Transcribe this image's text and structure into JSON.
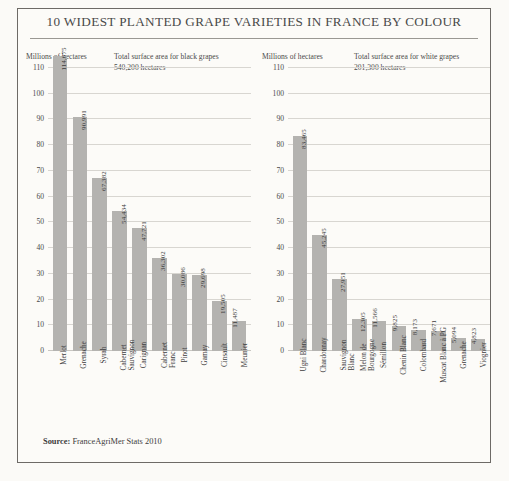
{
  "title": "10 WIDEST PLANTED GRAPE VARIETIES IN FRANCE BY COLOUR",
  "source_label": "Source:",
  "source_text": "FranceAgriMer Stats 2010",
  "axis_caption": "Millions of hectares",
  "panels": {
    "black": {
      "total_line1": "Total surface area for black grapes",
      "total_line2": "540,200 hectares"
    },
    "white": {
      "total_line1": "Total surface area for white grapes",
      "total_line2": "201,300 hectares"
    }
  },
  "yticks": [
    "110",
    "100",
    "90",
    "80",
    "70",
    "60",
    "50",
    "40",
    "30",
    "20",
    "10",
    "0"
  ],
  "colors": {
    "bar": "#b4b3b0",
    "frame": "#6d6a66",
    "grid": "#d8d6d1",
    "text": "#3c3c3c",
    "background": "#fcfbf8"
  },
  "chart_data": [
    {
      "type": "bar",
      "title": "Total surface area for black grapes",
      "subtitle": "540,200 hectares",
      "xlabel": "",
      "ylabel": "Millions of hectares",
      "ylim": [
        0,
        110
      ],
      "ytick_step": 10,
      "grid": true,
      "legend": "none",
      "units": "hectares",
      "value_scale": 1000,
      "categories": [
        "Merlot",
        "Grenache",
        "Syrah",
        "Cabernet Sauvignon",
        "Carignan",
        "Cabernet Franc",
        "Pinot",
        "Gamay",
        "Cinsault",
        "Meunier"
      ],
      "category_lines": [
        [
          "Merlot",
          ""
        ],
        [
          "Grenache",
          ""
        ],
        [
          "Syrah",
          ""
        ],
        [
          "Cabernet",
          "Sauvignon"
        ],
        [
          "Carignan",
          ""
        ],
        [
          "Cabernet",
          "Franc"
        ],
        [
          "Pinot",
          ""
        ],
        [
          "Gamay",
          ""
        ],
        [
          "Cinsault",
          ""
        ],
        [
          "Meunier",
          ""
        ]
      ],
      "values": [
        114675,
        90991,
        67382,
        54434,
        47721,
        36302,
        30086,
        29698,
        19505,
        11487
      ],
      "value_labels": [
        "114,675",
        "90,991",
        "67,382",
        "54,434",
        "47,721",
        "36,302",
        "30,086",
        "29,698",
        "19,505",
        "11,487"
      ]
    },
    {
      "type": "bar",
      "title": "Total surface area for white grapes",
      "subtitle": "201,300 hectares",
      "xlabel": "",
      "ylabel": "Millions of hectares",
      "ylim": [
        0,
        110
      ],
      "ytick_step": 10,
      "grid": true,
      "legend": "none",
      "units": "hectares",
      "value_scale": 1000,
      "categories": [
        "Ugni Blanc",
        "Chardonnay",
        "Sauvignon Blanc",
        "Melon de Bourgogne",
        "Sémillon",
        "Chenin Blanc",
        "Colombard",
        "Muscat Blanc à PG",
        "Grenache",
        "Viognier"
      ],
      "category_lines": [
        [
          "Ugni Blanc",
          ""
        ],
        [
          "Chardonnay",
          ""
        ],
        [
          "Sauvignon",
          "Blanc"
        ],
        [
          "Melon de",
          "Bourgogne"
        ],
        [
          "Sémillon",
          ""
        ],
        [
          "Chenin Blanc",
          ""
        ],
        [
          "Colombard",
          ""
        ],
        [
          "Muscat Blanc à PG",
          ""
        ],
        [
          "Grenache",
          ""
        ],
        [
          "Viognier",
          ""
        ]
      ],
      "values": [
        83465,
        45245,
        27951,
        12305,
        11566,
        9825,
        8173,
        7671,
        5094,
        4823
      ],
      "value_labels": [
        "83,465",
        "45,245",
        "27,951",
        "12,305",
        "11,566",
        "9,825",
        "8,173",
        "7,671",
        "5,094",
        "4,823"
      ]
    }
  ]
}
